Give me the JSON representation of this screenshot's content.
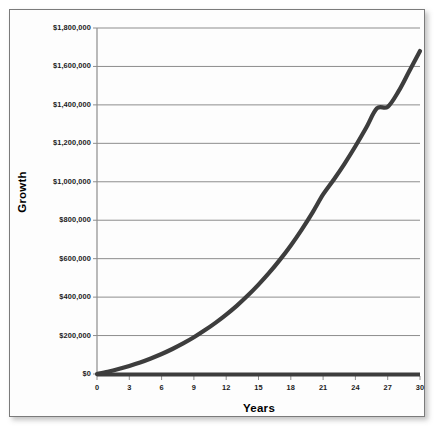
{
  "chart_data": {
    "type": "line",
    "title": "",
    "xlabel": "Years",
    "ylabel": "Growth",
    "xlim": [
      0,
      30
    ],
    "ylim": [
      0,
      1800000
    ],
    "grid": true,
    "legend": null,
    "x_ticks": [
      "0",
      "3",
      "6",
      "9",
      "12",
      "15",
      "18",
      "21",
      "24",
      "27",
      "30"
    ],
    "x_tick_values": [
      0,
      3,
      6,
      9,
      12,
      15,
      18,
      21,
      24,
      27,
      30
    ],
    "y_ticks": [
      "$0",
      "$200,000",
      "$400,000",
      "$600,000",
      "$800,000",
      "$1,000,000",
      "$1,200,000",
      "$1,400,000",
      "$1,600,000",
      "$1,800,000"
    ],
    "y_tick_values": [
      0,
      200000,
      400000,
      600000,
      800000,
      1000000,
      1200000,
      1400000,
      1600000,
      1800000
    ],
    "series": [
      {
        "name": "Growth",
        "color": "#3d3d3d",
        "x": [
          0,
          1,
          2,
          3,
          4,
          5,
          6,
          7,
          8,
          9,
          10,
          11,
          12,
          13,
          14,
          15,
          16,
          17,
          18,
          19,
          20,
          21,
          22,
          23,
          24,
          25,
          26,
          27,
          28,
          29,
          30
        ],
        "values": [
          0,
          12000,
          26000,
          42000,
          60000,
          81000,
          104000,
          130000,
          159000,
          191000,
          227000,
          266000,
          309000,
          356000,
          408000,
          465000,
          527000,
          595000,
          669000,
          750000,
          838000,
          934000,
          1012000,
          1095000,
          1185000,
          1281000,
          1382000,
          1390000,
          1470000,
          1575000,
          1680000
        ]
      }
    ]
  },
  "axes": {
    "y_title": "Growth",
    "x_title": "Years"
  }
}
